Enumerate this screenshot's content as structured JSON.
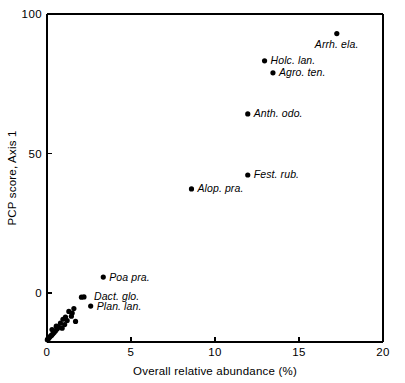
{
  "chart_data": {
    "type": "scatter",
    "title": "",
    "xlabel": "Overall relative abundance (%)",
    "ylabel": "PCP score, Axis 1",
    "xlim": [
      0,
      20
    ],
    "ylim": [
      -20,
      100
    ],
    "xticks": [
      0,
      5,
      10,
      15,
      20
    ],
    "xticklabels": [
      "0",
      "5",
      "10",
      "15",
      "20"
    ],
    "yticks": [
      0,
      50,
      100
    ],
    "yticklabels": [
      "0",
      "50",
      "100"
    ],
    "grid": false,
    "legend": null,
    "labeled_points": [
      {
        "label": "Arrh. ela.",
        "x": 17.25,
        "y": 93.0,
        "label_dx": -22,
        "label_dy": 14
      },
      {
        "label": "Holc. lan.",
        "x": 12.95,
        "y": 83.2,
        "label_dx": 6,
        "label_dy": 3.5
      },
      {
        "label": "Agro. ten.",
        "x": 13.45,
        "y": 78.9,
        "label_dx": 6,
        "label_dy": 3.5
      },
      {
        "label": "Anth. odo.",
        "x": 11.95,
        "y": 64.2,
        "label_dx": 6,
        "label_dy": 3.5
      },
      {
        "label": "Fest. rub.",
        "x": 11.95,
        "y": 42.3,
        "label_dx": 6,
        "label_dy": 3.5
      },
      {
        "label": "Alop. pra.",
        "x": 8.6,
        "y": 37.3,
        "label_dx": 6,
        "label_dy": 3.5
      },
      {
        "label": "Poa pra.",
        "x": 3.35,
        "y": 5.7,
        "label_dx": 6,
        "label_dy": 3.5
      },
      {
        "label": "Dact. glo.",
        "x": 2.2,
        "y": -1.4,
        "label_dx": 10,
        "label_dy": 3.5
      },
      {
        "label": "Plan. lan.",
        "x": 2.6,
        "y": -4.7,
        "label_dx": 6,
        "label_dy": 3.5
      }
    ],
    "unlabeled_points": [
      {
        "x": 2.05,
        "y": -1.5
      },
      {
        "x": 1.6,
        "y": -5.6
      },
      {
        "x": 1.5,
        "y": -7.2
      },
      {
        "x": 1.45,
        "y": -8.3
      },
      {
        "x": 1.3,
        "y": -6.6
      },
      {
        "x": 1.2,
        "y": -9.9
      },
      {
        "x": 1.7,
        "y": -10.2
      },
      {
        "x": 1.1,
        "y": -8.6
      },
      {
        "x": 0.95,
        "y": -9.4
      },
      {
        "x": 1.05,
        "y": -11.3
      },
      {
        "x": 0.8,
        "y": -10.8
      },
      {
        "x": 0.7,
        "y": -12.3
      },
      {
        "x": 0.6,
        "y": -12.9
      },
      {
        "x": 0.5,
        "y": -13.6
      },
      {
        "x": 0.42,
        "y": -14.2
      },
      {
        "x": 0.35,
        "y": -14.6
      },
      {
        "x": 0.28,
        "y": -15.1
      },
      {
        "x": 0.22,
        "y": -15.4
      },
      {
        "x": 0.16,
        "y": -15.8
      },
      {
        "x": 0.11,
        "y": -16.1
      },
      {
        "x": 0.07,
        "y": -16.4
      },
      {
        "x": 0.04,
        "y": -16.6
      },
      {
        "x": 0.02,
        "y": -16.8
      },
      {
        "x": 0.3,
        "y": -13.1
      },
      {
        "x": 0.55,
        "y": -11.9
      },
      {
        "x": 0.9,
        "y": -12.6
      }
    ]
  }
}
